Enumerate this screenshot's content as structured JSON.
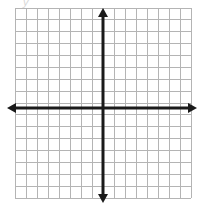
{
  "figure": {
    "type": "cartesian-grid",
    "background_color": "#ffffff",
    "partial_label": "y"
  },
  "grid": {
    "columns": 16,
    "rows": 16,
    "cell_size_px": 11,
    "left_px": 15,
    "top_px": 8,
    "right_px": 191,
    "bottom_px": 198,
    "line_color": "#b4b4b4",
    "line_width_px": 1,
    "border_color": "#b4b4b4"
  },
  "axes": {
    "origin_x_px": 103,
    "origin_y_px": 108,
    "color": "#1a1a1a",
    "line_width_px": 3,
    "x_axis": {
      "name": "x-axis",
      "label": "",
      "start_px": 7,
      "end_px": 197,
      "arrow_start": true,
      "arrow_end": true,
      "tick_labels": [],
      "min_unit": -8,
      "max_unit": 8
    },
    "y_axis": {
      "name": "y-axis",
      "label": "",
      "start_px": 8,
      "end_px": 203,
      "arrow_start": true,
      "arrow_end": true,
      "tick_labels": [],
      "min_unit": -8,
      "max_unit": 8
    },
    "arrowhead": {
      "length_px": 9,
      "half_width_px": 5
    }
  },
  "chart_data": {
    "type": "scatter",
    "title": "",
    "xlabel": "",
    "ylabel": "",
    "xlim": [
      -8,
      8
    ],
    "ylim": [
      -8,
      8
    ],
    "grid": true,
    "legend": false,
    "x": [],
    "y": [],
    "series": [],
    "annotations": []
  }
}
